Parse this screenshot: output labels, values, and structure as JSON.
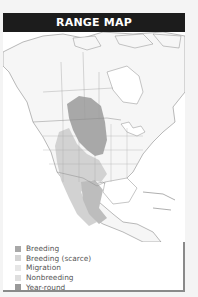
{
  "header": {
    "title": "RANGE MAP"
  },
  "legend": {
    "items": [
      {
        "label": "Breeding",
        "color": "#a8a8a8"
      },
      {
        "label": "Breeding (scarce)",
        "color": "#d4d4d4"
      },
      {
        "label": "Migration",
        "color": "#e6e6e6"
      },
      {
        "label": "Nonbreeding",
        "color": "#dedede"
      },
      {
        "label": "Year-round",
        "color": "#9a9a9a"
      }
    ]
  },
  "map": {
    "region": "North America",
    "land_color": "#f7f7f7",
    "border_color": "#8c8c8c"
  }
}
